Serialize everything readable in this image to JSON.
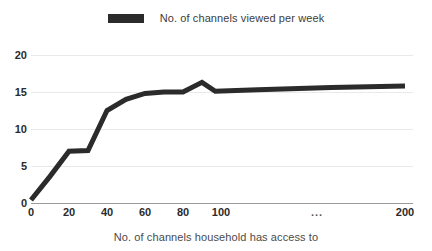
{
  "chart_data": {
    "type": "line",
    "title": "",
    "xlabel": "No. of channels household has access to",
    "ylabel": "",
    "legend": {
      "position": "top-center",
      "entries": [
        {
          "name": "No. of channels viewed per week",
          "color": "#2b2b2b",
          "marker": "bar"
        }
      ]
    },
    "series": [
      {
        "name": "No. of channels viewed per week",
        "color": "#2b2b2b",
        "x": [
          0,
          10,
          20,
          30,
          40,
          50,
          60,
          70,
          80,
          90,
          97,
          120,
          160,
          200
        ],
        "values": [
          0.4,
          3.6,
          7.0,
          7.1,
          12.5,
          14.0,
          14.8,
          15.0,
          15.0,
          16.3,
          15.1,
          15.3,
          15.6,
          15.8
        ]
      }
    ],
    "xlim": [
      0,
      200
    ],
    "ylim": [
      0,
      20
    ],
    "xticks": [
      0,
      20,
      40,
      60,
      80,
      100,
      null,
      200
    ],
    "xtick_labels": [
      "0",
      "20",
      "40",
      "60",
      "80",
      "100",
      "...",
      "200"
    ],
    "xtick_positions_px": [
      31,
      69,
      107,
      145,
      183,
      221,
      317,
      405
    ],
    "yticks": [
      0,
      5,
      10,
      15,
      20
    ],
    "ytick_labels": [
      "0",
      "5",
      "10",
      "15",
      "20"
    ],
    "grid": true,
    "grid_color": "#e9e9e9",
    "axis_color": "#9a9a9a",
    "background": "#ffffff"
  }
}
